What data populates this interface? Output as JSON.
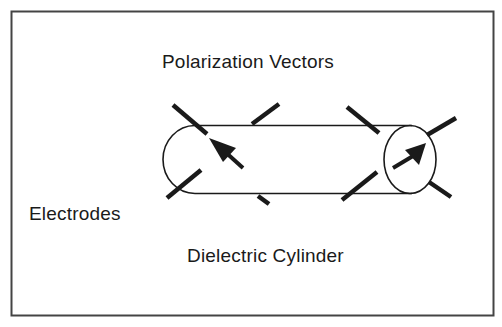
{
  "diagram": {
    "labels": {
      "polarization": "Polarization Vectors",
      "electrodes": "Electrodes",
      "cylinder": "Dielectric Cylinder"
    },
    "colors": {
      "stroke": "#1a1a1a",
      "frame": "#444444",
      "background": "#ffffff"
    },
    "elements": [
      "frame",
      "dielectric-cylinder",
      "electrode-bars",
      "polarization-arrows"
    ]
  }
}
